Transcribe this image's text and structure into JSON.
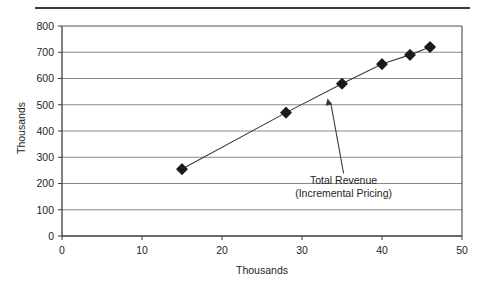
{
  "chart_data": {
    "type": "scatter",
    "title": "",
    "xlabel": "Thousands",
    "ylabel": "Thousands",
    "xlim": [
      0,
      50
    ],
    "ylim": [
      0,
      800
    ],
    "xticks": [
      "0",
      "10",
      "20",
      "30",
      "40",
      "50"
    ],
    "xtick_values": [
      0,
      10,
      20,
      30,
      40,
      50
    ],
    "yticks": [
      "0",
      "100",
      "200",
      "300",
      "400",
      "500",
      "600",
      "700",
      "800"
    ],
    "ytick_values": [
      0,
      100,
      200,
      300,
      400,
      500,
      600,
      700,
      800
    ],
    "grid": "horizontal",
    "legend": "none",
    "series": [
      {
        "name": "Total Revenue (Incremental Pricing)",
        "marker": "diamond",
        "marker_color": "#1a1a1a",
        "line_color": "#3a3a3a",
        "x": [
          15,
          28,
          35,
          40,
          43.5,
          46
        ],
        "y": [
          255,
          470,
          580,
          655,
          690,
          720
        ]
      }
    ],
    "annotations": [
      {
        "line1": "Total Revenue",
        "line2": "(Incremental Pricing)",
        "text_x": 35.2,
        "text_y": 200,
        "arrow_tip_x": 33.2,
        "arrow_tip_y": 525
      }
    ]
  },
  "colors": {
    "axis": "#3a3a3a",
    "gridline": "#8a8a8a",
    "marker": "#1a1a1a",
    "text": "#231f20",
    "rule": "#3a3a3a",
    "background": "#ffffff"
  }
}
